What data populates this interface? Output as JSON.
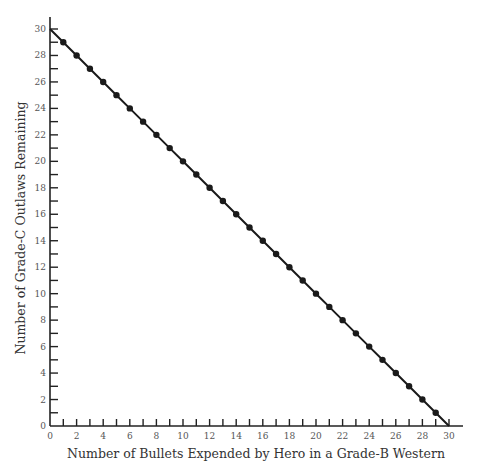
{
  "chart_data": {
    "type": "line",
    "title": "",
    "xlabel": "Number of Bullets Expended by Hero in a Grade-B Western",
    "ylabel": "Number of Grade-C Outlaws Remaining",
    "xlim": [
      0,
      30
    ],
    "ylim": [
      0,
      30
    ],
    "x_tick_labels": [
      "0",
      "2",
      "4",
      "6",
      "8",
      "10",
      "12",
      "14",
      "16",
      "18",
      "20",
      "22",
      "24",
      "26",
      "28",
      "30"
    ],
    "y_tick_labels": [
      "0",
      "2",
      "4",
      "6",
      "8",
      "10",
      "12",
      "14",
      "16",
      "18",
      "20",
      "22",
      "24",
      "26",
      "28",
      "30"
    ],
    "grid": false,
    "legend": null,
    "series": [
      {
        "name": "Outlaws remaining",
        "x": [
          0,
          1,
          2,
          3,
          4,
          5,
          6,
          7,
          8,
          9,
          10,
          11,
          12,
          13,
          14,
          15,
          16,
          17,
          18,
          19,
          20,
          21,
          22,
          23,
          24,
          25,
          26,
          27,
          28,
          29,
          30
        ],
        "values": [
          30,
          29,
          28,
          27,
          26,
          25,
          24,
          23,
          22,
          21,
          20,
          19,
          18,
          17,
          16,
          15,
          14,
          13,
          12,
          11,
          10,
          9,
          8,
          7,
          6,
          5,
          4,
          3,
          2,
          1,
          0
        ],
        "markers_at": [
          1,
          2,
          3,
          4,
          5,
          6,
          7,
          8,
          9,
          10,
          11,
          12,
          13,
          14,
          15,
          16,
          17,
          18,
          19,
          20,
          21,
          22,
          23,
          24,
          25,
          26,
          27,
          28,
          29
        ]
      }
    ],
    "colors": {
      "line": "#1a1a1a",
      "axis": "#222222",
      "text": "#444444"
    }
  }
}
